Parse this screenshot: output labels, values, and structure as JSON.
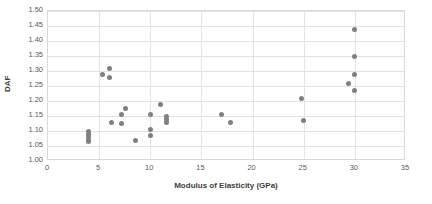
{
  "chart_data": {
    "type": "scatter",
    "title": "",
    "xlabel": "Modulus of Elasticity (GPa)",
    "ylabel": "DAF",
    "xlim": [
      0,
      35
    ],
    "ylim": [
      1.0,
      1.5
    ],
    "xticks": [
      0,
      5,
      10,
      15,
      20,
      25,
      30,
      35
    ],
    "ytick_labels": [
      "1.00",
      "1.05",
      "1.10",
      "1.15",
      "1.20",
      "1.25",
      "1.30",
      "1.35",
      "1.40",
      "1.45",
      "1.50"
    ],
    "yticks": [
      1.0,
      1.05,
      1.1,
      1.15,
      1.2,
      1.25,
      1.3,
      1.35,
      1.4,
      1.45,
      1.5
    ],
    "grid": true,
    "legend": false,
    "marker_color": "#808080",
    "series": [
      {
        "name": "DAF vs Modulus of Elasticity",
        "points": [
          [
            4.0,
            1.1
          ],
          [
            4.0,
            1.09
          ],
          [
            4.0,
            1.08
          ],
          [
            4.0,
            1.07
          ],
          [
            4.0,
            1.065
          ],
          [
            5.3,
            1.29
          ],
          [
            6.0,
            1.31
          ],
          [
            6.0,
            1.28
          ],
          [
            6.2,
            1.13
          ],
          [
            7.2,
            1.155
          ],
          [
            7.2,
            1.125
          ],
          [
            7.6,
            1.175
          ],
          [
            8.6,
            1.07
          ],
          [
            10.0,
            1.155
          ],
          [
            10.0,
            1.105
          ],
          [
            10.0,
            1.085
          ],
          [
            11.0,
            1.19
          ],
          [
            11.6,
            1.15
          ],
          [
            11.6,
            1.14
          ],
          [
            11.6,
            1.13
          ],
          [
            17.0,
            1.155
          ],
          [
            17.8,
            1.13
          ],
          [
            24.8,
            1.21
          ],
          [
            25.0,
            1.135
          ],
          [
            29.4,
            1.26
          ],
          [
            30.0,
            1.44
          ],
          [
            30.0,
            1.35
          ],
          [
            30.0,
            1.29
          ],
          [
            30.0,
            1.235
          ]
        ]
      }
    ]
  }
}
